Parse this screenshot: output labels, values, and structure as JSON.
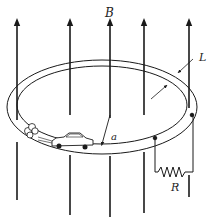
{
  "diagram": {
    "labels": {
      "field": "B",
      "track_width": "L",
      "radius": "a",
      "resistor": "R"
    },
    "field_lines_x": [
      17,
      70,
      110,
      144,
      189
    ],
    "colors": {
      "stroke": "#1a1a1a",
      "background": "#ffffff"
    }
  }
}
